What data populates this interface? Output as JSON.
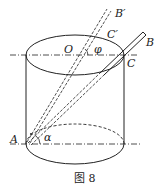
{
  "figure": {
    "caption": "图 8",
    "labels": {
      "A": "A",
      "B": "B",
      "B_prime": "B′",
      "C": "C",
      "C_prime": "C′",
      "O": "O",
      "alpha": "α",
      "phi": "φ"
    },
    "colors": {
      "stroke": "#222222",
      "background": "#ffffff"
    }
  }
}
